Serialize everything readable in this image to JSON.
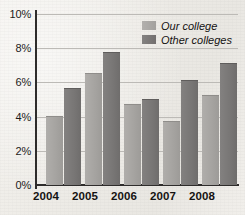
{
  "chart_data": {
    "type": "bar",
    "title": "",
    "subtitle": "",
    "xlabel": "",
    "ylabel": "",
    "categories": [
      "2004",
      "2005",
      "2006",
      "2007",
      "2008"
    ],
    "series": [
      {
        "name": "Our college",
        "color": "#a5a3a0",
        "values": [
          4.0,
          6.5,
          4.7,
          3.7,
          5.2
        ]
      },
      {
        "name": "Other colleges",
        "color": "#787675",
        "values": [
          5.6,
          7.7,
          5.0,
          6.1,
          7.1
        ]
      }
    ],
    "ylim": [
      0,
      10
    ],
    "ytick_values": [
      0,
      2,
      4,
      6,
      8,
      10
    ],
    "ytick_labels": [
      "0%",
      "2%",
      "4%",
      "6%",
      "8%",
      "10%"
    ],
    "grid": true,
    "grid_axis": "y",
    "legend_position": "top-right-inside",
    "value_unit": "%"
  },
  "legend": {
    "entries": [
      {
        "label": "Our college"
      },
      {
        "label": "Other colleges"
      }
    ]
  },
  "axes": {
    "y_labels": [
      "10%",
      "8%",
      "6%",
      "4%",
      "2%",
      "0%"
    ],
    "x_labels": [
      "2004",
      "2005",
      "2006",
      "2007",
      "2008"
    ]
  },
  "colors": {
    "series_our_college": "#a5a3a0",
    "series_other_colleges": "#787675",
    "axis": "#2e2c2b",
    "gridline": "#bcbab6",
    "background": "#efedea",
    "text": "#151312"
  }
}
